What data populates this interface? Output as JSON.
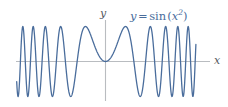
{
  "figure": {
    "background_color": "#ffffff",
    "width": 228,
    "height": 107
  },
  "labels": {
    "y_axis": "y",
    "x_axis": "x",
    "equation_y": "y",
    "equation_equals": "=",
    "equation_function": "sin",
    "equation_open_paren": "(",
    "equation_variable": "x",
    "equation_exponent": "2",
    "equation_close_paren": ")",
    "equation_full": "y = sin (x²)"
  },
  "colors": {
    "curve": "#4a6d9c",
    "axis": "#b9bcc0",
    "label_text": "#55595e",
    "equation_text": "#4a6d9c"
  },
  "chart_data": {
    "type": "line",
    "title": "",
    "subtitle": "",
    "xlabel": "x",
    "ylabel": "y",
    "function": "y = sin(x^2)",
    "legend": [
      "y = sin (x²)"
    ],
    "legend_position": "top-right",
    "grid": false,
    "axes_style": "centered-cross",
    "xlim": [
      -5.6,
      5.6
    ],
    "ylim": [
      -1.35,
      1.35
    ],
    "x_axis_pixel_y": 61.5,
    "y_axis_pixel_x": 105.5,
    "x_pixels_per_unit": 16.0,
    "y_pixels_per_unit": 35.0,
    "curve_x_start": -5.55,
    "curve_x_end": 5.65,
    "samples": 1400,
    "series": [
      {
        "name": "y = sin (x²)",
        "color": "#4a6d9c",
        "line_width": 1.3,
        "x": [
          -5.6,
          -5.4,
          -5.2,
          -5.0,
          -4.8,
          -4.6,
          -4.4,
          -4.2,
          -4.0,
          -3.8,
          -3.6,
          -3.4,
          -3.2,
          -3.0,
          -2.8,
          -2.6,
          -2.4,
          -2.2,
          -2.0,
          -1.8,
          -1.6,
          -1.4,
          -1.2,
          -1.0,
          -0.8,
          -0.6,
          -0.4,
          -0.2,
          0.0,
          0.2,
          0.4,
          0.6,
          0.8,
          1.0,
          1.2,
          1.4,
          1.6,
          1.8,
          2.0,
          2.2,
          2.4,
          2.6,
          2.8,
          3.0,
          3.2,
          3.4,
          3.6,
          3.8,
          4.0,
          4.2,
          4.4,
          4.6,
          4.8,
          5.0,
          5.2,
          5.4,
          5.6
        ],
        "y": [
          -0.011,
          0.859,
          0.705,
          -0.132,
          -0.878,
          -0.597,
          0.347,
          0.956,
          0.288,
          -0.952,
          -0.344,
          0.998,
          -0.022,
          -0.412,
          0.307,
          0.994,
          -0.598,
          -0.999,
          0.757,
          0.181,
          -0.577,
          -0.925,
          0.991,
          0.841,
          0.595,
          0.353,
          0.159,
          0.04,
          0.0,
          0.04,
          0.159,
          0.353,
          0.595,
          0.841,
          0.991,
          0.925,
          -0.577,
          0.181,
          0.757,
          -0.999,
          -0.598,
          0.994,
          0.307,
          -0.412,
          -0.022,
          0.998,
          -0.344,
          -0.952,
          0.288,
          0.956,
          0.347,
          -0.597,
          -0.878,
          -0.132,
          0.705,
          0.859,
          -0.011
        ]
      }
    ],
    "annotations": [
      {
        "text": "y",
        "role": "y-axis-name",
        "x_px": 104,
        "y_px": 14
      },
      {
        "text": "x",
        "role": "x-axis-name",
        "x_px": 217,
        "y_px": 60
      },
      {
        "text": "y = sin (x²)",
        "role": "curve-label",
        "x_px": 160,
        "y_px": 16
      }
    ]
  }
}
